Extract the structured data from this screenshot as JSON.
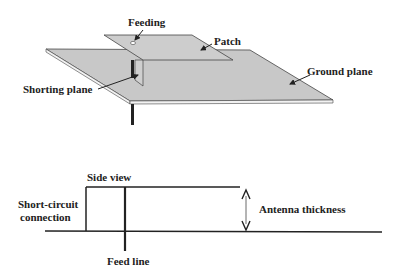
{
  "diagram": {
    "top_view": {
      "labels": {
        "feeding": "Feeding",
        "patch": "Patch",
        "ground_plane": "Ground plane",
        "shorting_plane": "Shorting plane"
      }
    },
    "side_view": {
      "title": "Side view",
      "labels": {
        "short_circuit_line1": "Short-circuit",
        "short_circuit_line2": "connection",
        "antenna_thickness": "Antenna thickness",
        "feed_line": "Feed line"
      }
    },
    "colors": {
      "plane_fill": "#c8c8c8",
      "line": "#222222",
      "background": "#ffffff"
    }
  }
}
